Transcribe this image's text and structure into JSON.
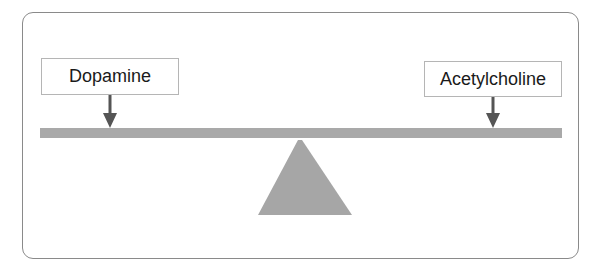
{
  "diagram": {
    "type": "seesaw-balance",
    "labels": [
      {
        "text": "Dopamine",
        "side": "left"
      },
      {
        "text": "Acetylcholine",
        "side": "right"
      }
    ],
    "colors": {
      "beam": "#a9a9a9",
      "fulcrum": "#a6a6a6",
      "arrow": "#555555",
      "frame_border": "#8a8a8a"
    }
  }
}
